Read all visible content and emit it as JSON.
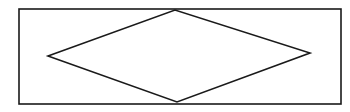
{
  "diagram": {
    "type": "rhombus-in-rectangle",
    "stroke_color": "#1a1a1a",
    "background": "#ffffff",
    "rectangle": {
      "x": 19,
      "y": 9,
      "width": 322,
      "height": 95
    },
    "rhombus": {
      "left": [
        48,
        56
      ],
      "top": [
        175,
        10
      ],
      "right": [
        310,
        53
      ],
      "bottom": [
        177,
        102
      ]
    }
  }
}
